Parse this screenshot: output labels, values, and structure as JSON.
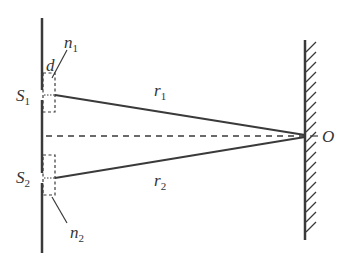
{
  "diagram": {
    "type": "double-slit interference with mirror screen",
    "colors": {
      "line": "#3a3a3a",
      "background": "#ffffff"
    },
    "labels": {
      "s1": {
        "main": "S",
        "sub": "1"
      },
      "s2": {
        "main": "S",
        "sub": "2"
      },
      "n1": {
        "main": "n",
        "sub": "1"
      },
      "n2": {
        "main": "n",
        "sub": "2"
      },
      "d": {
        "main": "d"
      },
      "r1": {
        "main": "r",
        "sub": "1"
      },
      "r2": {
        "main": "r",
        "sub": "2"
      },
      "o": {
        "main": "O"
      }
    },
    "elements": [
      "slit-screen",
      "slit-S1",
      "slit-S2",
      "dashed-box-n1",
      "dashed-box-n2",
      "ray-r1",
      "ray-r2",
      "center-dashed-axis",
      "hatched-screen",
      "point-O"
    ]
  }
}
